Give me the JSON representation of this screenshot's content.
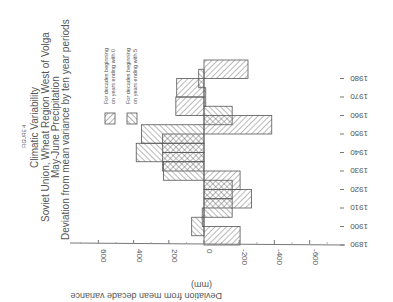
{
  "figure_label": "FIGURE 4",
  "title_lines": [
    "Climatic Variability",
    "Soviet Union, Wheat Region West of Volga",
    "May-June Precipitation",
    "Deviation from mean variance by ten year periods"
  ],
  "legend": [
    {
      "label_line1": "For decades beginning",
      "label_line2": "on years ending with 0",
      "hatch": "series0"
    },
    {
      "label_line1": "For decades beginning",
      "label_line2": "on years ending with 5",
      "hatch": "series5"
    }
  ],
  "axis": {
    "value_label": "Deviation from mean decade variance",
    "value_unit": "(mm)",
    "value_ticks": [
      "600",
      "400",
      "200",
      "0",
      "-200",
      "-400",
      "-600"
    ],
    "year_ticks": [
      "1890",
      "1900",
      "1910",
      "1920",
      "1930",
      "1940",
      "1950",
      "1960",
      "1970",
      "1980"
    ]
  },
  "chart_data": {
    "type": "bar",
    "orientation": "rotated 180 deg (image upside down); bars horizontal in view",
    "xlabel": "Year",
    "ylabel": "Deviation from mean decade variance (mm)",
    "ylim": [
      -700,
      700
    ],
    "grid": false,
    "legend_position": "upper-left (in view)",
    "series": [
      {
        "name": "For decades beginning on years ending with 0",
        "x": [
          1890,
          1900,
          1910,
          1920,
          1930,
          1940,
          1950,
          1960,
          1970,
          1980
        ],
        "values": [
          -205,
          10,
          -270,
          -205,
          235,
          235,
          -385,
          160,
          155,
          -250
        ]
      },
      {
        "name": "For decades beginning on years ending with 5",
        "x": [
          1895,
          1905,
          1915,
          1925,
          1935,
          1945,
          1955,
          1965,
          1975
        ],
        "values": [
          70,
          -160,
          -160,
          230,
          385,
          355,
          -160,
          -10,
          30
        ]
      }
    ]
  }
}
